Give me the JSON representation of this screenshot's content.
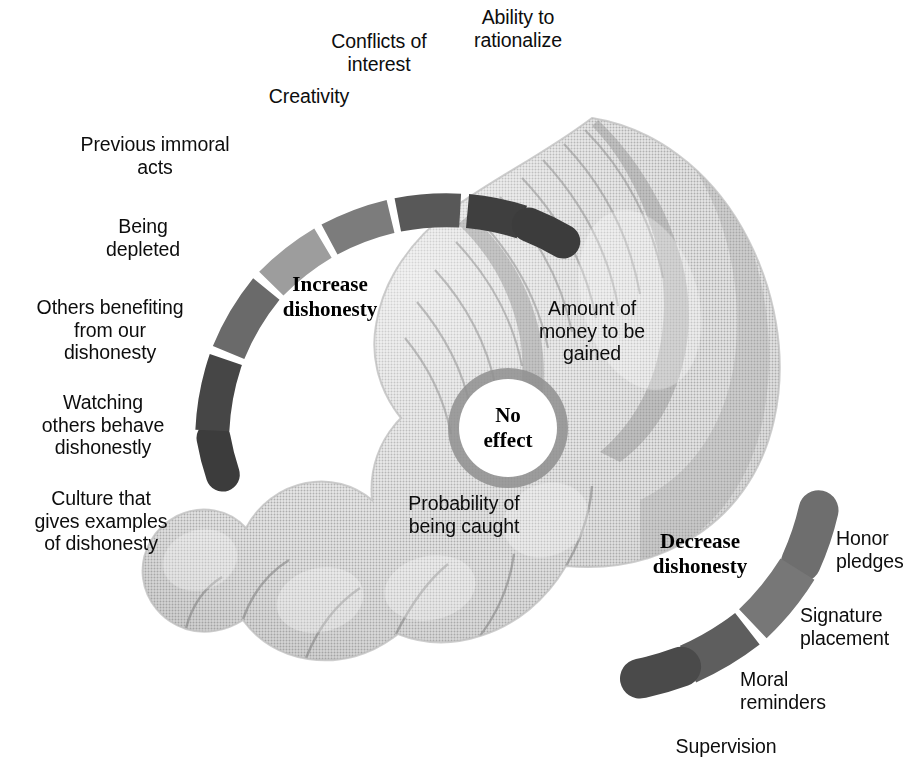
{
  "figure": {
    "background": "#ffffff",
    "hand_illustration": "halftone-hand-holding-coin",
    "ink_dark": "#3c3c3c",
    "ink_mid": "#6e6e6e",
    "ink_light": "#9e9e9e"
  },
  "hub": {
    "label": "No\neffect",
    "fill": "#ffffff",
    "ring": "#8f8f8f"
  },
  "increase": {
    "title": "Increase\ndishonesty",
    "title_x": 330,
    "title_y": 272,
    "segments": [
      {
        "label": "Ability to\nrationalize",
        "color": "#3c3c3c",
        "lx": 518,
        "ly": 6,
        "align": "c"
      },
      {
        "label": "Conflicts of\ninterest",
        "color": "#3f3f3f",
        "lx": 379,
        "ly": 30,
        "align": "c"
      },
      {
        "label": "Creativity",
        "color": "#585858",
        "lx": 309,
        "ly": 85,
        "align": "c"
      },
      {
        "label": "Previous immoral\nacts",
        "color": "#7c7c7c",
        "lx": 247,
        "ly": 133,
        "align": "r"
      },
      {
        "label": "Being\ndepleted",
        "color": "#9d9d9d",
        "lx": 214,
        "ly": 215,
        "align": "r"
      },
      {
        "label": "Others benefiting\nfrom our\ndishonesty",
        "color": "#6a6a6a",
        "lx": 197,
        "ly": 296,
        "align": "r"
      },
      {
        "label": "Watching\nothers behave\ndishonestly",
        "color": "#464646",
        "lx": 186,
        "ly": 391,
        "align": "r"
      },
      {
        "label": "Culture that\ngives examples\nof dishonesty",
        "color": "#3c3c3c",
        "lx": 180,
        "ly": 487,
        "align": "r"
      }
    ]
  },
  "decrease": {
    "title": "Decrease\ndishonesty",
    "title_x": 700,
    "title_y": 529,
    "segments": [
      {
        "label": "Honor\npledges",
        "color": "#6e6e6e",
        "lx": 836,
        "ly": 527,
        "align": "l"
      },
      {
        "label": "Signature\nplacement",
        "color": "#777777",
        "lx": 800,
        "ly": 604,
        "align": "l"
      },
      {
        "label": "Moral\nreminders",
        "color": "#5e5e5e",
        "lx": 740,
        "ly": 668,
        "align": "l"
      },
      {
        "label": "Supervision",
        "color": "#4a4a4a",
        "lx": 726,
        "ly": 735,
        "align": "r"
      }
    ]
  },
  "no_effect_factors": [
    {
      "label": "Amount of\nmoney to be\ngained",
      "lx": 592,
      "ly": 297,
      "align": "c"
    },
    {
      "label": "Probability of\nbeing caught",
      "lx": 464,
      "ly": 492,
      "align": "c"
    }
  ]
}
